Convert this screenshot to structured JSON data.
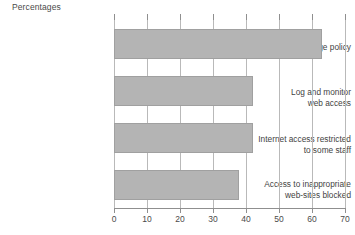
{
  "chart_data": {
    "type": "bar",
    "orientation": "horizontal",
    "title": "Percentages",
    "xlabel": "",
    "ylabel": "",
    "xlim": [
      0,
      70
    ],
    "xticks": [
      0,
      10,
      20,
      30,
      40,
      50,
      60,
      70
    ],
    "grid": true,
    "legend": false,
    "bar_color": "#b4b4b4",
    "bar_border_color": "#a0a0a0",
    "categories": [
      "Acceptable usage policy",
      "Log and monitor\nweb access",
      "Internet access restricted\nto some staff",
      "Access to inappropriate\nweb-sites blocked"
    ],
    "values": [
      63,
      42,
      42,
      38
    ],
    "tick_labels": [
      "0",
      "10",
      "20",
      "30",
      "40",
      "50",
      "60",
      "70"
    ]
  }
}
